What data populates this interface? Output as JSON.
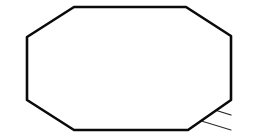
{
  "figure": {
    "kind": "technical-line-drawing",
    "background_color": "#ffffff",
    "outline_color": "#0a0a0a",
    "band_color": "#2b2b2b",
    "hatch_color": "#3a3a3a",
    "canvas": {
      "width": 260,
      "height": 138
    }
  },
  "outline": {
    "name": "octagon-boundary",
    "stroke_width": 2.6,
    "points": [
      [
        74,
        7
      ],
      [
        186,
        7
      ],
      [
        231,
        36
      ],
      [
        231,
        100
      ],
      [
        188,
        130
      ],
      [
        74,
        130
      ],
      [
        27,
        100
      ],
      [
        27,
        37
      ]
    ]
  },
  "bands": [
    {
      "name": "band-descending",
      "direction": "upper-left-to-lower-right",
      "hatched": true,
      "upper_edge": [
        [
          27,
          37
        ],
        [
          231,
          100
        ]
      ],
      "lower_edge": [
        [
          27,
          68
        ],
        [
          231,
          130
        ]
      ],
      "spine": [
        [
          27,
          52
        ],
        [
          231,
          115
        ]
      ]
    },
    {
      "name": "band-ascending",
      "direction": "lower-left-to-upper-right",
      "hatched": false,
      "upper_edge": [
        [
          27,
          100
        ],
        [
          231,
          36
        ]
      ],
      "lower_edge": [
        [
          74,
          130
        ],
        [
          231,
          80
        ]
      ],
      "spine": [
        [
          27,
          100
        ],
        [
          231,
          36
        ]
      ]
    }
  ],
  "hatch_marks": {
    "name": "fin-hatch-series",
    "count": 34,
    "stem_height": 26,
    "cap_length": 9,
    "cap_drop": 5,
    "description": "rows of small vertical fins rising from the descending band spine"
  },
  "cross_lines": [
    {
      "name": "diagonal-a",
      "points": [
        [
          74,
          7
        ],
        [
          231,
          100
        ]
      ]
    },
    {
      "name": "diagonal-b",
      "points": [
        [
          186,
          7
        ],
        [
          27,
          100
        ]
      ]
    },
    {
      "name": "diagonal-c",
      "points": [
        [
          74,
          130
        ],
        [
          231,
          36
        ]
      ]
    },
    {
      "name": "diagonal-d",
      "points": [
        [
          27,
          68
        ],
        [
          188,
          130
        ]
      ]
    }
  ]
}
